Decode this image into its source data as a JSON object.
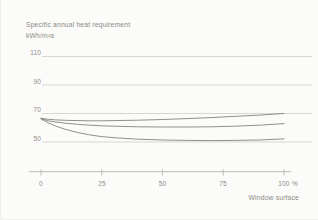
{
  "chart": {
    "title": "Specific annual heat requirement",
    "unit_label": "kWh/m²a",
    "y_axis": {
      "tick_labels": [
        "110",
        "90",
        "70",
        "50"
      ]
    },
    "x_axis": {
      "tick_labels": [
        "0",
        "25",
        "50",
        "75",
        "100"
      ],
      "unit": "%",
      "title": "Window surface"
    }
  },
  "colors": {
    "background": "#fbfbf9",
    "text": "#8b8b87",
    "gridline": "#cecec9",
    "axis": "#a8a8a3",
    "curve": "#82827d"
  },
  "chart_data": {
    "type": "line",
    "title": "Specific annual heat requirement",
    "ylabel": "kWh/m²a",
    "xlabel": "Window surface",
    "x_unit": "%",
    "x": [
      0,
      3,
      6,
      10,
      15,
      20,
      25,
      30,
      40,
      50,
      60,
      70,
      80,
      90,
      100
    ],
    "series": [
      {
        "name": "upper-curve",
        "values": [
          66.6,
          65.9,
          65.5,
          65.2,
          65.0,
          64.9,
          64.9,
          65.0,
          65.3,
          65.8,
          66.4,
          67.1,
          68.0,
          68.9,
          70.0
        ]
      },
      {
        "name": "middle-curve",
        "values": [
          66.4,
          64.9,
          64.0,
          63.2,
          62.4,
          61.8,
          61.4,
          61.1,
          60.7,
          60.5,
          60.5,
          60.7,
          61.1,
          61.8,
          62.9
        ]
      },
      {
        "name": "lower-curve",
        "values": [
          66.2,
          63.4,
          61.2,
          58.9,
          56.7,
          55.0,
          53.8,
          53.0,
          52.0,
          51.4,
          51.1,
          51.0,
          51.1,
          51.4,
          52.2
        ]
      }
    ],
    "xlim": [
      0,
      100
    ],
    "ylim": [
      45,
      115
    ],
    "y_gridlines": [
      50,
      70,
      90,
      110
    ],
    "x_ticks": [
      0,
      25,
      50,
      75,
      100
    ],
    "grid": true,
    "legend": false
  }
}
